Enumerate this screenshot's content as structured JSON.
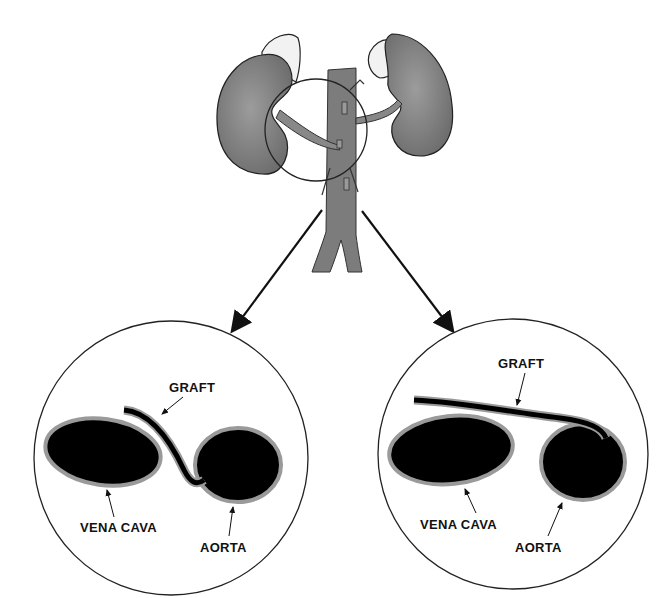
{
  "diagram": {
    "type": "anatomical-illustration",
    "top_figure": "kidneys-with-vena-cava-and-aorta",
    "left_panel": {
      "labels": {
        "graft": "GRAFT",
        "vena_cava": "VENA CAVA",
        "aorta": "AORTA"
      }
    },
    "right_panel": {
      "labels": {
        "graft": "GRAFT",
        "vena_cava": "VENA CAVA",
        "aorta": "AORTA"
      }
    },
    "colors": {
      "organ": "#8a8a8a",
      "vessel_fill": "#000000",
      "vessel_rim": "#9a9a9a",
      "outline": "#222222"
    }
  }
}
